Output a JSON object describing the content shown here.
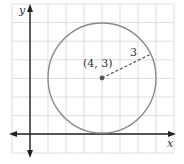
{
  "diagram": {
    "type": "coordinate-plane-circle",
    "grid": {
      "x_min_px": 12,
      "x_max_px": 174,
      "y_min_px": 4,
      "y_max_px": 153,
      "x_step_px": 18,
      "y_step_px": 18.6,
      "color": "#dddddd"
    },
    "axes": {
      "origin_px": [
        30,
        134
      ],
      "x_label": "x",
      "y_label": "y",
      "color": "#222222"
    },
    "circle": {
      "center": [
        4,
        3
      ],
      "radius": 3,
      "center_px": [
        102,
        78
      ],
      "radius_px": [
        54,
        55
      ],
      "stroke": "#8a8a8a"
    },
    "center_point": {
      "label": "(4, 3)",
      "color": "#555555"
    },
    "radius_segment": {
      "label": "3",
      "end_px": [
        151,
        54
      ],
      "style": "dashed",
      "color": "#555555"
    }
  }
}
